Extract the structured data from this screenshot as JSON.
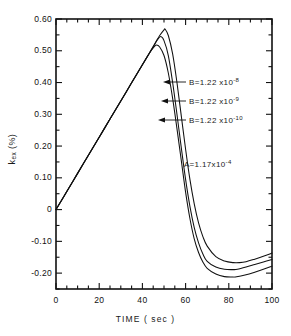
{
  "chart_data": {
    "type": "line",
    "title": "",
    "xlabel": "TIME ( sec )",
    "ylabel_main": "k",
    "ylabel_sub": "ex",
    "ylabel_unit": " (%)",
    "xlim": [
      0,
      100
    ],
    "ylim": [
      -0.25,
      0.6
    ],
    "grid": false,
    "legend_position": "inline-annotations",
    "x_ticks": [
      0,
      20,
      40,
      60,
      80,
      100
    ],
    "x_tick_labels": [
      "0",
      "20",
      "40",
      "60",
      "80",
      "100"
    ],
    "x_minor_tick_step": 5,
    "y_ticks": [
      0.6,
      0.5,
      0.4,
      0.3,
      0.2,
      0.1,
      0.0,
      -0.1,
      -0.2
    ],
    "y_tick_labels": [
      "0.60",
      "0.50",
      "0.40",
      "0.30",
      "0.20",
      "0.10",
      "0",
      "-0.10",
      "-0.20"
    ],
    "y_minor_tick_step": 0.05,
    "series": [
      {
        "name": "B=1.22x10^-8",
        "label_prefix": "B=1.22 x10",
        "label_exponent": "-8",
        "peak_x": 50.5,
        "peak_y": 0.568,
        "min_x": 85,
        "min_y": -0.167,
        "end_y": -0.137,
        "x": [
          0,
          5,
          10,
          15,
          20,
          25,
          30,
          35,
          40,
          43,
          46,
          48,
          50,
          50.5,
          52,
          54,
          56,
          58,
          60,
          62,
          64,
          66,
          68,
          70,
          74,
          78,
          82,
          85,
          88,
          92,
          96,
          100
        ],
        "values": [
          0.0,
          0.057,
          0.114,
          0.171,
          0.228,
          0.285,
          0.342,
          0.399,
          0.456,
          0.49,
          0.525,
          0.548,
          0.566,
          0.568,
          0.548,
          0.49,
          0.4,
          0.295,
          0.19,
          0.095,
          0.018,
          -0.042,
          -0.085,
          -0.115,
          -0.148,
          -0.162,
          -0.167,
          -0.167,
          -0.164,
          -0.156,
          -0.147,
          -0.137
        ]
      },
      {
        "name": "B=1.22x10^-9",
        "label_prefix": "B=1.22 x10",
        "label_exponent": "-9",
        "peak_x": 48.5,
        "peak_y": 0.545,
        "min_x": 84,
        "min_y": -0.188,
        "end_y": -0.157,
        "x": [
          0,
          5,
          10,
          15,
          20,
          25,
          30,
          35,
          40,
          43,
          45,
          47,
          48.5,
          50,
          52,
          54,
          56,
          58,
          60,
          62,
          64,
          66,
          68,
          70,
          74,
          78,
          82,
          84,
          88,
          92,
          96,
          100
        ],
        "values": [
          0.0,
          0.057,
          0.114,
          0.171,
          0.228,
          0.285,
          0.342,
          0.399,
          0.456,
          0.49,
          0.512,
          0.535,
          0.545,
          0.532,
          0.485,
          0.4,
          0.3,
          0.195,
          0.095,
          0.01,
          -0.057,
          -0.105,
          -0.14,
          -0.163,
          -0.181,
          -0.188,
          -0.189,
          -0.188,
          -0.181,
          -0.173,
          -0.165,
          -0.157
        ]
      },
      {
        "name": "B=1.22x10^-10",
        "label_prefix": "B=1.22 x10",
        "label_exponent": "-10",
        "peak_x": 46.5,
        "peak_y": 0.518,
        "min_x": 83,
        "min_y": -0.212,
        "end_y": -0.178,
        "x": [
          0,
          5,
          10,
          15,
          20,
          25,
          30,
          35,
          40,
          42,
          44,
          45.5,
          46.5,
          48,
          50,
          52,
          54,
          56,
          58,
          60,
          62,
          64,
          66,
          68,
          70,
          74,
          78,
          82,
          83,
          88,
          92,
          96,
          100
        ],
        "values": [
          0.0,
          0.057,
          0.114,
          0.171,
          0.228,
          0.285,
          0.342,
          0.399,
          0.456,
          0.479,
          0.5,
          0.513,
          0.518,
          0.512,
          0.485,
          0.43,
          0.35,
          0.255,
          0.155,
          0.055,
          -0.028,
          -0.092,
          -0.135,
          -0.165,
          -0.185,
          -0.203,
          -0.211,
          -0.212,
          -0.212,
          -0.205,
          -0.197,
          -0.188,
          -0.178
        ]
      }
    ],
    "annotations": [
      {
        "name": "parameter-A",
        "prefix": "A=1.17x10",
        "exponent": "-4",
        "x": 62,
        "y": 0.145
      }
    ]
  }
}
